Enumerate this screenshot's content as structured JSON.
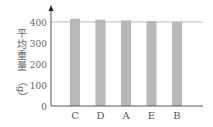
{
  "chart_data": {
    "type": "bar",
    "title": "",
    "xlabel": "",
    "ylabel": "平均重量（g）",
    "ylabel_chars": [
      "平",
      "均",
      "重",
      "量"
    ],
    "ylabel_unit": "（g）",
    "categories": [
      "C",
      "D",
      "A",
      "E",
      "B"
    ],
    "values": [
      415,
      411,
      408,
      405,
      401
    ],
    "yticks": [
      0,
      100,
      200,
      300,
      400
    ],
    "ylim": [
      0,
      440
    ],
    "grid": "horizontal line at 400 only",
    "legend": "none",
    "bar_color": "#b8b8b8",
    "axis_color": "#555555"
  }
}
